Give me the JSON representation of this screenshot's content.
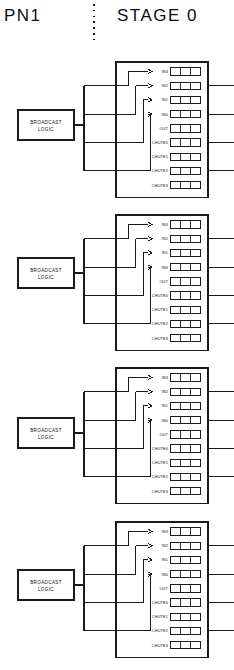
{
  "header": {
    "left_label": "PN1",
    "right_label": "STAGE 0",
    "divider": "dotted-vertical-line"
  },
  "style": {
    "line_color": "#1a1a1a",
    "background": "#ffffff",
    "text_color": "#111111"
  },
  "broadcast_logic": {
    "label_line1": "BROADCAST",
    "label_line2": "LOGIC",
    "count": 4
  },
  "module": {
    "register_cells": 3,
    "rows": [
      {
        "label": "IN3",
        "kind": "input",
        "arrow": true,
        "edge_stub": false
      },
      {
        "label": "IN2",
        "kind": "input",
        "arrow": true,
        "edge_stub": true
      },
      {
        "label": "IN1",
        "kind": "input",
        "arrow": true,
        "edge_stub": false
      },
      {
        "label": "IN0",
        "kind": "input",
        "arrow": true,
        "edge_stub": true
      },
      {
        "label": "OUT",
        "kind": "output",
        "arrow": false,
        "edge_stub": false
      },
      {
        "label": "CHUTE0",
        "kind": "chute",
        "arrow": false,
        "edge_stub": true
      },
      {
        "label": "CHUTE1",
        "kind": "chute",
        "arrow": false,
        "edge_stub": false
      },
      {
        "label": "CHUTE2",
        "kind": "chute",
        "arrow": false,
        "edge_stub": true
      },
      {
        "label": "CHUTE3",
        "kind": "chute",
        "arrow": false,
        "edge_stub": false
      }
    ]
  },
  "modules": [
    {
      "id": "module-0",
      "index": 0
    },
    {
      "id": "module-1",
      "index": 1
    },
    {
      "id": "module-2",
      "index": 2
    },
    {
      "id": "module-3",
      "index": 3
    }
  ]
}
